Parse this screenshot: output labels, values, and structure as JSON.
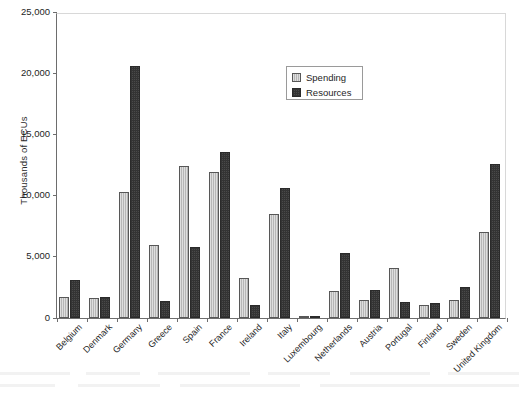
{
  "chart_data": {
    "type": "bar",
    "title": "",
    "xlabel": "",
    "ylabel": "Thousands of ECUs",
    "ylim": [
      0,
      25000
    ],
    "yticks": [
      0,
      5000,
      10000,
      15000,
      20000,
      25000
    ],
    "ytick_labels": [
      "0",
      "5,000",
      "10,000",
      "15,000",
      "20,000",
      "25,000"
    ],
    "grid": false,
    "legend_position": "upper center",
    "categories": [
      "Belgium",
      "Denmark",
      "Germany",
      "Greece",
      "Spain",
      "France",
      "Ireland",
      "Italy",
      "Luxembourg",
      "Netherlands",
      "Austria",
      "Portugal",
      "Finland",
      "Sweden",
      "United Kingdom"
    ],
    "series": [
      {
        "name": "Spending",
        "color": "#b6b6b6",
        "values": [
          1700,
          1600,
          10300,
          5950,
          12400,
          11900,
          3300,
          8500,
          200,
          2200,
          1500,
          4100,
          1100,
          1500,
          7000
        ]
      },
      {
        "name": "Resources",
        "color": "#4a4a4a",
        "values": [
          3100,
          1700,
          20600,
          1350,
          5800,
          13600,
          1100,
          10600,
          200,
          5300,
          2300,
          1300,
          1200,
          2500,
          12600
        ]
      }
    ]
  },
  "legend": {
    "items": [
      {
        "label": "Spending",
        "icon": "legend-swatch-spending"
      },
      {
        "label": "Resources",
        "icon": "legend-swatch-resources"
      }
    ]
  }
}
